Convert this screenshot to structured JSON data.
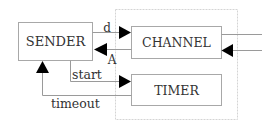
{
  "diagram": {
    "colors": {
      "line": "#9a9a9a",
      "box": "#a8a8a8",
      "dotted": "#d0d0d0",
      "arrow": "#000000",
      "text": "#333333"
    },
    "nodes": {
      "sender": {
        "label": "SENDER"
      },
      "channel": {
        "label": "CHANNEL"
      },
      "timer": {
        "label": "TIMER"
      }
    },
    "edges": {
      "data": {
        "label": "d",
        "from": "SENDER",
        "to": "CHANNEL"
      },
      "ack": {
        "label": "A",
        "from": "CHANNEL",
        "to": "SENDER"
      },
      "start": {
        "label": "start",
        "from": "SENDER",
        "to": "TIMER"
      },
      "timeout": {
        "label": "timeout",
        "from": "TIMER",
        "to": "SENDER"
      },
      "channel_out": {
        "label": "",
        "from": "CHANNEL",
        "to": "external"
      },
      "channel_in": {
        "label": "",
        "from": "external",
        "to": "CHANNEL"
      }
    }
  }
}
